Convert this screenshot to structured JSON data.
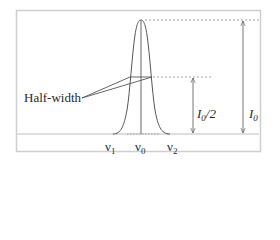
{
  "diagram": {
    "type": "spectral line profile",
    "labels": {
      "half_width": "Half-width",
      "nu1": "ν",
      "nu1_sub": "1",
      "nu0": "ν",
      "nu0_sub": "0",
      "nu2": "ν",
      "nu2_sub": "2",
      "i0_half": "I",
      "i0_half_sub": "0",
      "i0_half_suffix": "/2",
      "i0": "I",
      "i0_sub": "0"
    },
    "colors": {
      "line": "#555555",
      "frame": "#cfcfcf",
      "baseline": "#bdbdbd",
      "dotted": "#9a9a9a",
      "text": "#2a2a2a"
    }
  }
}
